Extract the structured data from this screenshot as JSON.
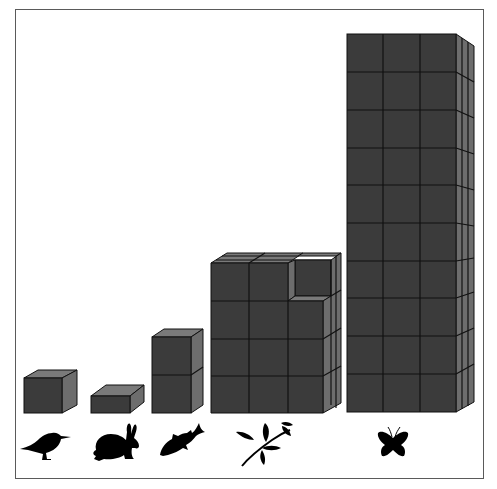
{
  "diagram": {
    "type": "pictograph-cube-stacks",
    "colors": {
      "front_face": "#3b3b3b",
      "side_face": "#6d6d6d",
      "top_face": "#7a7a7a",
      "grid_line": "#111111",
      "frame": "#5a5a5a",
      "icon": "#000000"
    },
    "stacks": [
      {
        "organism": "bird",
        "icon": "bird-icon",
        "cubes_wide": 1,
        "cubes_tall": 1,
        "cubes_deep": 1,
        "note": "single cube"
      },
      {
        "organism": "rabbit",
        "icon": "rabbit-icon",
        "cubes_wide": 1,
        "cubes_tall": 0.5,
        "cubes_deep": 1,
        "note": "half-height block"
      },
      {
        "organism": "fish",
        "icon": "fish-icon",
        "cubes_wide": 1,
        "cubes_tall": 2,
        "cubes_deep": 1,
        "note": "two stacked cubes"
      },
      {
        "organism": "plant",
        "icon": "plant-sprig-icon",
        "cubes_wide": 3,
        "cubes_tall": 4,
        "cubes_deep": 3,
        "note": "top-right front cube missing"
      },
      {
        "organism": "butterfly",
        "icon": "butterfly-icon",
        "cubes_wide": 3,
        "cubes_tall": 10,
        "cubes_deep": 3,
        "note": "tallest stack"
      }
    ]
  }
}
